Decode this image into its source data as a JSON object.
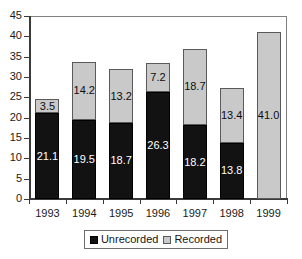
{
  "chart_data": {
    "type": "bar",
    "stacked": true,
    "title": "",
    "subtitle": "",
    "xlabel": "",
    "ylabel": "",
    "categories": [
      "1993",
      "1994",
      "1995",
      "1996",
      "1997",
      "1998",
      "1999"
    ],
    "series": [
      {
        "name": "Unrecorded",
        "color": "#121212",
        "values": [
          21.1,
          19.5,
          18.7,
          26.3,
          18.2,
          13.8,
          null
        ],
        "labels": [
          "21.1",
          "19.5",
          "18.7",
          "26.3",
          "18.2",
          "13.8",
          ""
        ]
      },
      {
        "name": "Recorded",
        "color": "#c9c9c9",
        "values": [
          3.5,
          14.2,
          13.2,
          7.2,
          18.7,
          13.4,
          41.0
        ],
        "labels": [
          "3.5",
          "14.2",
          "13.2",
          "7.2",
          "18.7",
          "13.4",
          "41.0"
        ]
      }
    ],
    "totals": [
      24.6,
      33.7,
      31.9,
      33.5,
      36.9,
      27.2,
      41.0
    ],
    "ylim": [
      0,
      45
    ],
    "ytick_step": 5,
    "yticks": [
      "45",
      "40",
      "35",
      "30",
      "25",
      "20",
      "15",
      "10",
      "5",
      "0"
    ],
    "grid": false,
    "legend_position": "bottom",
    "legend_entries": [
      "Unrecorded",
      "Recorded"
    ]
  },
  "colors": {
    "unrecorded": "#121212",
    "recorded": "#c9c9c9",
    "axis": "#3a3a3a",
    "frame": "#808080",
    "background": "#ffffff"
  }
}
